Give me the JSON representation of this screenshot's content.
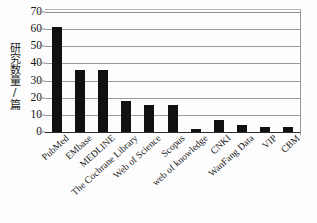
{
  "chart_data": {
    "type": "bar",
    "title": "",
    "subtitle": "",
    "xlabel": "",
    "ylabel": "研究数量/篇",
    "categories": [
      "PubMed",
      "EMbase",
      "MEDLINE",
      "The Cochrane Library",
      "Web of Science",
      "Scopus",
      "web of knowledge",
      "CNKI",
      "WanFang Data",
      "VIP",
      "CBM"
    ],
    "values": [
      61,
      36,
      36,
      18,
      16,
      16,
      2,
      7,
      4,
      3,
      3
    ],
    "ylim": [
      0,
      70
    ],
    "ytick_values": [
      0,
      10,
      20,
      30,
      40,
      50,
      60,
      70
    ],
    "ytick_labels": [
      "0",
      "10",
      "20",
      "30",
      "40",
      "50",
      "60",
      "70"
    ],
    "grid": true,
    "legend": false,
    "legend_position": "none",
    "bar_color": "#111111",
    "gridline_color": "#9a9a9a",
    "axis_color": "#2b2b2b"
  }
}
